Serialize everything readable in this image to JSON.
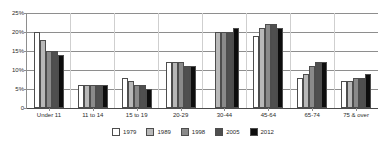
{
  "chart_data": {
    "type": "bar",
    "title": "",
    "subtitle": "",
    "xlabel": "",
    "ylabel": "",
    "ylim": [
      0,
      25
    ],
    "y_ticks": [
      0,
      5,
      10,
      15,
      20,
      25
    ],
    "y_tick_labels": [
      "0",
      "5%",
      "10%",
      "15%",
      "20%",
      "25%"
    ],
    "grid": true,
    "legend_position": "bottom",
    "categories": [
      "Under 11",
      "11 to 14",
      "15 to 19",
      "20-29",
      "30-44",
      "45-64",
      "65-74",
      "75 & over"
    ],
    "series": [
      {
        "name": "1979",
        "color": "#ffffff",
        "values": [
          20,
          6,
          8,
          12,
          null,
          19,
          8,
          7
        ]
      },
      {
        "name": "1989",
        "color": "#b8b8b8",
        "values": [
          18,
          6,
          7,
          12,
          20,
          21,
          9,
          7
        ]
      },
      {
        "name": "1998",
        "color": "#8a8a8a",
        "values": [
          15,
          6,
          6,
          12,
          20,
          22,
          11,
          8
        ]
      },
      {
        "name": "2005",
        "color": "#4f4f4f",
        "values": [
          15,
          6,
          6,
          11,
          20,
          22,
          12,
          8
        ]
      },
      {
        "name": "2012",
        "color": "#0d0d0d",
        "values": [
          14,
          6,
          5,
          11,
          21,
          21,
          12,
          9
        ]
      }
    ]
  },
  "legend": {
    "items": [
      {
        "label": "1979"
      },
      {
        "label": "1989"
      },
      {
        "label": "1998"
      },
      {
        "label": "2005"
      },
      {
        "label": "2012"
      }
    ]
  },
  "axis": {
    "y_labels": [
      "25%",
      "20%",
      "15%",
      "10%",
      "5%",
      "0"
    ],
    "x_labels": [
      "Under 11",
      "11 to 14",
      "15 to 19",
      "20-29",
      "30-44",
      "45-64",
      "65-74",
      "75 & over"
    ]
  },
  "colors": {
    "grid": "#8e8e8e",
    "axis": "#8e8e8e",
    "text": "#2b2b2b",
    "background": "#ffffff"
  }
}
